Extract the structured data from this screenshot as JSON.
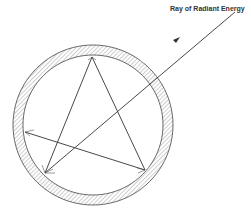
{
  "diagram": {
    "label": "Ray of Radiant Energy",
    "colors": {
      "line": "#333333",
      "hatch": "#777777"
    }
  }
}
